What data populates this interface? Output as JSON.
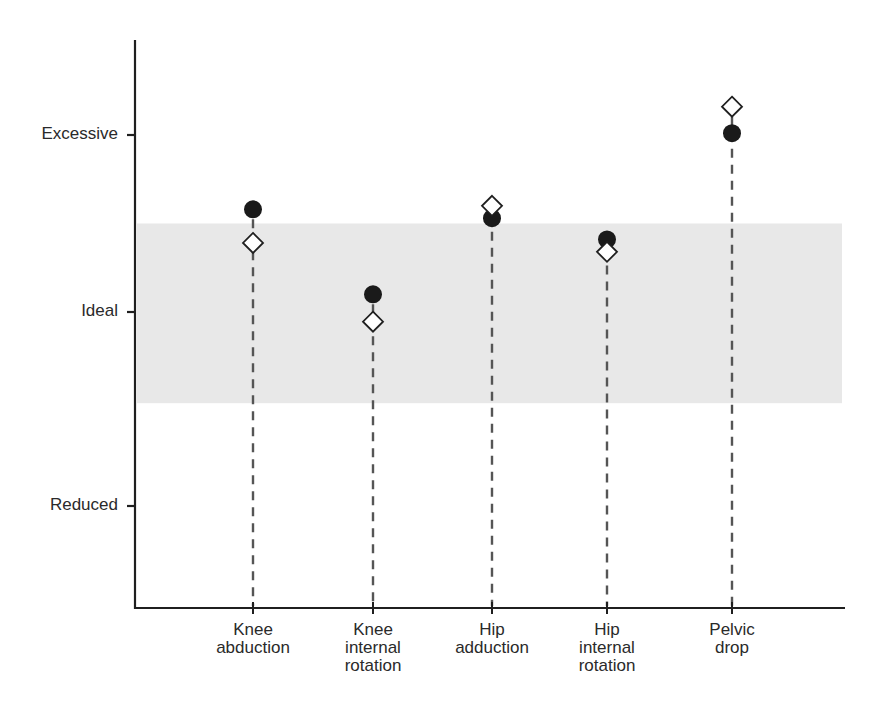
{
  "chart_data": {
    "type": "scatter",
    "title": "",
    "xlabel": "",
    "ylabel": "",
    "categories": [
      "Knee abduction",
      "Knee internal rotation",
      "Hip adduction",
      "Hip internal rotation",
      "Pelvic drop"
    ],
    "category_lines": [
      [
        "Knee",
        "abduction"
      ],
      [
        "Knee",
        "internal",
        "rotation"
      ],
      [
        "Hip",
        "adduction"
      ],
      [
        "Hip",
        "internal",
        "rotation"
      ],
      [
        "Pelvic",
        "drop"
      ]
    ],
    "y_ticks": [
      {
        "label": "Excessive",
        "value": 1
      },
      {
        "label": "Ideal",
        "value": 0
      },
      {
        "label": "Reduced",
        "value": -1
      }
    ],
    "ylim": [
      -1.5,
      1.4
    ],
    "ideal_band": {
      "from": -0.47,
      "to": 0.5,
      "color": "#e8e8e8"
    },
    "series": [
      {
        "name": "filled circle",
        "marker": "circle",
        "color": "#1a1a1a",
        "values": [
          0.58,
          0.1,
          0.53,
          0.41,
          1.01
        ]
      },
      {
        "name": "open diamond",
        "marker": "diamond",
        "color": "#ffffff",
        "values": [
          0.39,
          -0.05,
          0.6,
          0.34,
          1.16
        ]
      }
    ],
    "grid": false,
    "legend": null,
    "drop_lines": "dashed"
  }
}
